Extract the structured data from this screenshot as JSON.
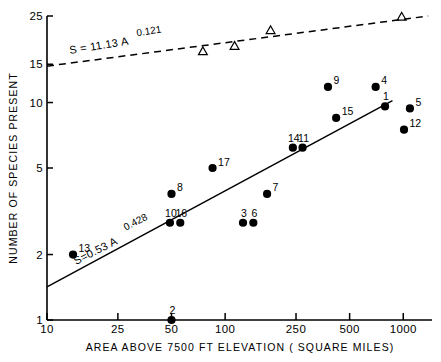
{
  "chart_data": {
    "type": "scatter",
    "title": "",
    "xlabel": "AREA ABOVE 7500 FT ELEVATION ( SQUARE MILES)",
    "ylabel": "NUMBER OF SPECIES PRESENT",
    "xscale": "log",
    "yscale": "log",
    "xlim": [
      10,
      1450
    ],
    "ylim": [
      1,
      25
    ],
    "xticks": [
      10,
      25,
      50,
      100,
      250,
      500,
      1000
    ],
    "xtick_labels": [
      "10",
      "25",
      "50",
      "100",
      "250",
      "500",
      "1000"
    ],
    "yticks": [
      1,
      2,
      5,
      10,
      15,
      25
    ],
    "ytick_labels": [
      "1",
      "2",
      "5",
      "10",
      "15",
      "25"
    ],
    "grid": false,
    "legend": "none",
    "series": [
      {
        "name": "mammals",
        "marker": "filled-circle",
        "color": "#000000",
        "points": [
          {
            "label": "13",
            "x": 14,
            "y": 2.0,
            "label_pos": "right"
          },
          {
            "label": "2",
            "x": 50,
            "y": 1.0,
            "label_pos": "above"
          },
          {
            "label": "10",
            "x": 49,
            "y": 2.8,
            "label_pos": "above"
          },
          {
            "label": "16",
            "x": 56,
            "y": 2.8,
            "label_pos": "above"
          },
          {
            "label": "8",
            "x": 50,
            "y": 3.8,
            "label_pos": "right"
          },
          {
            "label": "17",
            "x": 85,
            "y": 5.0,
            "label_pos": "right"
          },
          {
            "label": "3",
            "x": 126,
            "y": 2.8,
            "label_pos": "above"
          },
          {
            "label": "6",
            "x": 144,
            "y": 2.8,
            "label_pos": "above"
          },
          {
            "label": "7",
            "x": 172,
            "y": 3.8,
            "label_pos": "right"
          },
          {
            "label": "14",
            "x": 240,
            "y": 6.2,
            "label_pos": "above"
          },
          {
            "label": "11",
            "x": 272,
            "y": 6.2,
            "label_pos": "above"
          },
          {
            "label": "15",
            "x": 420,
            "y": 8.5,
            "label_pos": "right"
          },
          {
            "label": "9",
            "x": 378,
            "y": 11.8,
            "label_pos": "right"
          },
          {
            "label": "4",
            "x": 700,
            "y": 11.8,
            "label_pos": "right"
          },
          {
            "label": "1",
            "x": 790,
            "y": 9.6,
            "label_pos": "above"
          },
          {
            "label": "5",
            "x": 1090,
            "y": 9.4,
            "label_pos": "right"
          },
          {
            "label": "12",
            "x": 1010,
            "y": 7.5,
            "label_pos": "right"
          }
        ]
      },
      {
        "name": "birds",
        "marker": "open-triangle",
        "color": "#000000",
        "points": [
          {
            "label": "",
            "x": 75,
            "y": 17.2
          },
          {
            "label": "",
            "x": 113,
            "y": 18.2
          },
          {
            "label": "",
            "x": 180,
            "y": 21.5
          },
          {
            "label": "",
            "x": 980,
            "y": 24.8
          }
        ]
      }
    ],
    "fit_lines": [
      {
        "name": "birds-fit",
        "style": "dashed",
        "equation": "S = 11.13 A",
        "exponent": "0.121",
        "coefficient": 11.13,
        "power": 0.121,
        "x_start": 10,
        "x_end": 1380,
        "y_start": 14.7,
        "y_end": 25.0
      },
      {
        "name": "mammals-fit",
        "style": "solid",
        "equation": "S = 0.53 A",
        "exponent": "0.428",
        "coefficient": 0.53,
        "power": 0.428,
        "x_start": 10,
        "x_end": 870,
        "y_start": 1.42,
        "y_end": 10.2
      }
    ]
  },
  "annotations": {
    "birds_eq_main": "S = 11.13 A",
    "birds_eq_sup": "0.121",
    "mammals_eq_main": "S=0.53 A",
    "mammals_eq_sup": "0.428"
  }
}
